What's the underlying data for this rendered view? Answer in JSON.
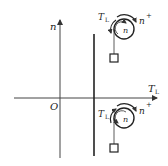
{
  "diagram": {
    "axes": {
      "x_label": "T",
      "x_label_sub": "L",
      "y_label": "n",
      "origin_label": "O"
    },
    "upper_pulley": {
      "torque_label": "T",
      "torque_sub": "L",
      "speed_label_outer": "n",
      "speed_sign": "+",
      "speed_label_inner": "n"
    },
    "lower_pulley": {
      "torque_label": "T",
      "torque_sub": "L",
      "speed_label_outer": "n",
      "speed_sign": "+",
      "speed_label_inner": "n"
    },
    "colors": {
      "line": "#333333",
      "background": "#ffffff"
    }
  }
}
